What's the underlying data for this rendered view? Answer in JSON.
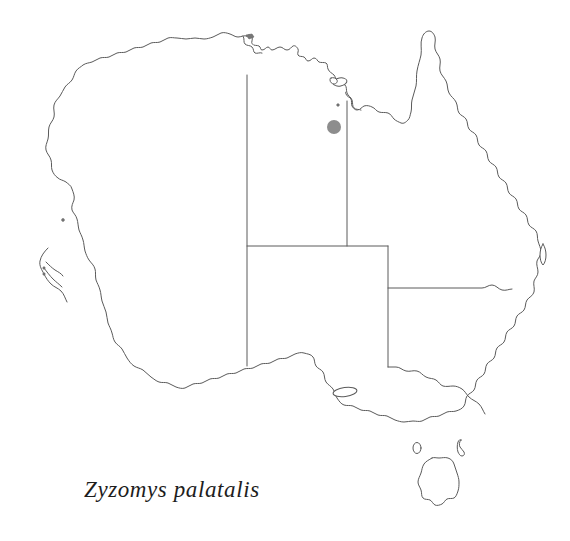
{
  "figure": {
    "type": "species-distribution-map",
    "region": "Australia",
    "background_color": "#ffffff",
    "caption": "Zyzomys palatalis",
    "caption_style": "italic-serif"
  },
  "map": {
    "outline_color": "#5a5a5a",
    "outline_width": 1,
    "fill_color": "#ffffff",
    "state_border_color": "#5a5a5a",
    "states_shown": [
      "Western Australia",
      "Northern Territory",
      "South Australia",
      "Queensland",
      "New South Wales",
      "Victoria",
      "Tasmania"
    ],
    "islands_shown": [
      "Tasmania",
      "King Island",
      "Flinders Island",
      "Kangaroo Island",
      "Fraser Island",
      "Groote Eylandt",
      "Melville Island",
      "Dirk Hartog Island"
    ]
  },
  "occurrences": {
    "marker_color": "#8d8d8d",
    "marker_radius": 7,
    "count": 1,
    "points": [
      {
        "x": 334,
        "y": 127,
        "label": "occurrence-point-1"
      }
    ]
  }
}
